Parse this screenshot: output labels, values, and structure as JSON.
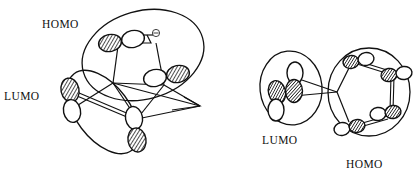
{
  "figure": {
    "type": "orbital-interaction-diagram",
    "background_color": "#ffffff",
    "stroke_color": "#111111",
    "lobe_filled_color": "#2b2b2b",
    "lobe_empty_color": "#ffffff"
  },
  "left_diagram": {
    "homo_label": "HOMO",
    "lumo_label": "LUMO",
    "electron_charge_symbol": "⊖",
    "homo_group": {
      "name": "HOMO",
      "orbital_pairs": 2,
      "center_x": 143,
      "center_y": 55,
      "rx": 62,
      "ry": 46,
      "rotation_deg": -18
    },
    "lumo_group": {
      "name": "LUMO",
      "orbital_pairs": 2,
      "center_x": 103,
      "center_y": 112,
      "rx": 48,
      "ry": 28,
      "rotation_deg": 52
    }
  },
  "right_diagram": {
    "lumo_label": "LUMO",
    "homo_label": "HOMO",
    "lumo_group": {
      "name": "LUMO",
      "orbital_pairs": 2,
      "center_x": 290,
      "center_y": 88,
      "rx": 31,
      "ry": 38,
      "rotation_deg": -8
    },
    "homo_group": {
      "name": "HOMO",
      "orbital_pairs": 4,
      "center_x": 369,
      "center_y": 92,
      "rx": 41,
      "ry": 45,
      "rotation_deg": 0
    }
  }
}
